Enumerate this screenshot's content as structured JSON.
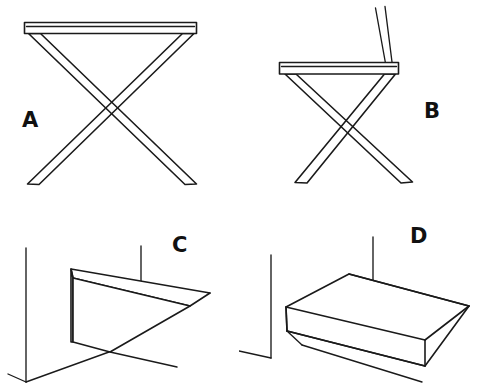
{
  "sheet": {
    "title": "Four line drawings of folding furniture and wall shelves",
    "background_color": "#ffffff",
    "ink_color": "#1a1a1a",
    "width": 478,
    "height": 391
  },
  "figures": [
    {
      "id": "A",
      "label": "A",
      "label_x": 22,
      "label_y": 127,
      "subject": "x-frame folding table",
      "description": "Flat rectangular tabletop slab supported by two crossed legs forming an X",
      "parts": [
        "tabletop-slab",
        "left-leg",
        "right-leg",
        "left-foot",
        "right-foot"
      ]
    },
    {
      "id": "B",
      "label": "B",
      "label_x": 424,
      "label_y": 118,
      "subject": "x-frame folding chair",
      "description": "Seat slab on crossed X legs with two parallel backrest rails rising at the right",
      "parts": [
        "seat-slab",
        "backrest-rail-front",
        "backrest-rail-back",
        "left-leg",
        "right-leg",
        "left-foot",
        "right-foot"
      ]
    },
    {
      "id": "C",
      "label": "C",
      "label_x": 172,
      "label_y": 252,
      "subject": "wall shelf seen edge-on",
      "description": "Vertical wall corner line at left with a thin rectangular shelf slab projecting to the right, front face visible",
      "parts": [
        "wall-vertical-line",
        "floor-line",
        "shelf-top-face",
        "shelf-front-face",
        "shelf-under-edge"
      ]
    },
    {
      "id": "D",
      "label": "D",
      "label_x": 410,
      "label_y": 243,
      "subject": "wall shelf seen from above",
      "description": "Vertical wall corner line at left with a thin rectangular shelf slab projecting right, top face broadly visible",
      "parts": [
        "wall-vertical-line",
        "floor-line",
        "shelf-top-face",
        "shelf-front-edge-face",
        "shelf-under-edge"
      ]
    }
  ]
}
